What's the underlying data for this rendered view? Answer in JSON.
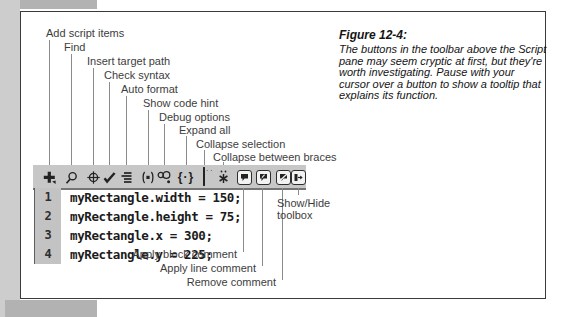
{
  "figure": {
    "title": "Figure 12-4:",
    "caption": "The buttons in the toolbar above the Script pane may seem cryptic at first, but they're worth investigating. Pause with your cursor over a button to show a tooltip that explains its function."
  },
  "toolbar": {
    "buttons": [
      {
        "label": "Add script items",
        "icon": "plus-icon"
      },
      {
        "label": "Find",
        "icon": "magnifier-icon"
      },
      {
        "label": "Insert target path",
        "icon": "target-icon"
      },
      {
        "label": "Check syntax",
        "icon": "checkmark-icon"
      },
      {
        "label": "Auto format",
        "icon": "format-lines-icon"
      },
      {
        "label": "Show code hint",
        "icon": "code-hint-icon"
      },
      {
        "label": "Debug options",
        "icon": "debug-icon"
      },
      {
        "label": "Expand all",
        "icon": "braces-icon"
      },
      {
        "label": "Collapse selection",
        "icon": "collapse-selection-icon"
      },
      {
        "label": "Collapse between braces",
        "icon": "collapse-braces-icon"
      },
      {
        "label": "Apply block comment",
        "icon": "block-comment-icon"
      },
      {
        "label": "Apply line comment",
        "icon": "line-comment-icon"
      },
      {
        "label": "Remove comment",
        "icon": "remove-comment-icon"
      },
      {
        "label": "Show/Hide toolbox",
        "icon": "toolbox-icon"
      }
    ]
  },
  "script_pane": {
    "lines": [
      {
        "number": "1",
        "code": "myRectangle.width = 150;"
      },
      {
        "number": "2",
        "code": "myRectangle.height = 75;"
      },
      {
        "number": "3",
        "code": "myRectangle.x = 300;"
      },
      {
        "number": "4",
        "code": "myRectangle.y = 225;"
      }
    ]
  },
  "colors": {
    "toolbar_bg": "#c7c7c7",
    "gutter_bg": "#c3c3c3",
    "figure_border": "#3a3a3a",
    "page_margin_gray": "#cdcdcd",
    "band_gray": "#b2b2b2"
  }
}
